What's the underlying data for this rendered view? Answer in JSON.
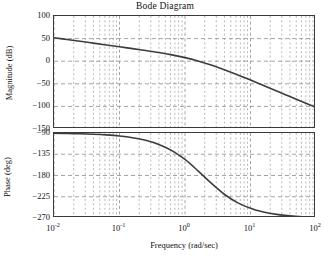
{
  "figure": {
    "title": "Bode Diagram",
    "xlabel": "Frequency  (rad/sec)",
    "mag_ylabel": "Magnitude (dB)",
    "pha_ylabel": "Phase (deg)",
    "line_color": "#3d3d3d",
    "grid_color": "#9a9a9a",
    "axis_color": "#3a3a3a"
  },
  "ticks": {
    "x": [
      {
        "label": "10",
        "exp": "-2",
        "value": -2
      },
      {
        "label": "10",
        "exp": "-1",
        "value": -1
      },
      {
        "label": "10",
        "exp": "0",
        "value": 0
      },
      {
        "label": "10",
        "exp": "1",
        "value": 1
      },
      {
        "label": "10",
        "exp": "2",
        "value": 2
      }
    ],
    "mag_y": [
      "100",
      "50",
      "0",
      "−50",
      "−100",
      "−150"
    ],
    "pha_y": [
      "−90",
      "−135",
      "−180",
      "−225",
      "−270"
    ]
  },
  "chart_data": {
    "type": "line",
    "title": "Bode Diagram",
    "xlabel": "Frequency  (rad/sec)",
    "xscale": "log",
    "xlim": [
      0.01,
      100
    ],
    "grid": true,
    "legend": "none",
    "subplots": [
      {
        "name": "magnitude",
        "ylabel": "Magnitude (dB)",
        "ylim": [
          -150,
          100
        ],
        "yticks": [
          100,
          50,
          0,
          -50,
          -100,
          -150
        ],
        "x": [
          0.01,
          0.0158,
          0.0251,
          0.0398,
          0.0631,
          0.1,
          0.158,
          0.251,
          0.398,
          0.631,
          1.0,
          1.58,
          2.51,
          3.98,
          6.31,
          10.0,
          15.8,
          25.1,
          39.8,
          63.1,
          100.0
        ],
        "values": [
          52.0,
          48.0,
          44.0,
          40.0,
          36.0,
          31.9,
          27.8,
          23.6,
          19.1,
          14.0,
          7.9,
          0.4,
          -8.5,
          -18.8,
          -30.0,
          -41.8,
          -53.8,
          -66.0,
          -78.2,
          -90.4,
          -102.6
        ]
      },
      {
        "name": "phase",
        "ylabel": "Phase (deg)",
        "ylim": [
          -270,
          -90
        ],
        "yticks": [
          -90,
          -135,
          -180,
          -225,
          -270
        ],
        "x": [
          0.01,
          0.0158,
          0.0251,
          0.0398,
          0.0631,
          0.1,
          0.158,
          0.251,
          0.398,
          0.631,
          1.0,
          1.58,
          2.51,
          3.98,
          6.31,
          10.0,
          15.8,
          25.1,
          39.8,
          63.1,
          100.0
        ],
        "values": [
          -90.6,
          -91.0,
          -91.6,
          -92.5,
          -94.0,
          -96.3,
          -99.9,
          -105.5,
          -114.2,
          -127.3,
          -146.1,
          -170.2,
          -196.3,
          -219.7,
          -237.4,
          -249.5,
          -257.4,
          -262.4,
          -265.5,
          -267.4,
          -268.6
        ]
      }
    ]
  }
}
